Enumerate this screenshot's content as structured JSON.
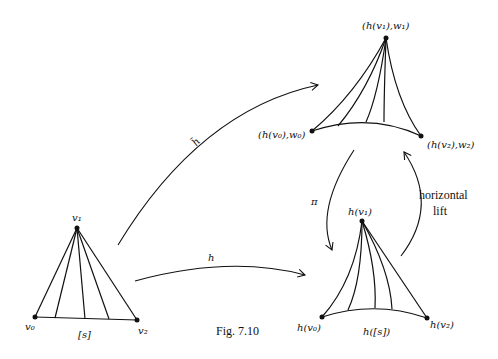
{
  "figure": {
    "caption": "Fig. 7.10",
    "stroke_color": "#111111"
  },
  "simplex": {
    "label": "[s]",
    "vertices": {
      "v0": "v₀",
      "v1": "v₁",
      "v2": "v₂"
    }
  },
  "lifted_simplex": {
    "vertices": {
      "v0": "(h(v₀),w₀)",
      "v1": "(h(v₁),w₁)",
      "v2": "(h(v₂),w₂)"
    }
  },
  "image_simplex": {
    "label": "h([s])",
    "vertices": {
      "v0": "h(v₀)",
      "v1": "h(v₁)",
      "v2": "h(v₂)"
    }
  },
  "arrows": {
    "h_tilde": "h̃",
    "h": "h",
    "pi": "π",
    "horizontal_lift_line1": "horizontal",
    "horizontal_lift_line2": "lift"
  }
}
